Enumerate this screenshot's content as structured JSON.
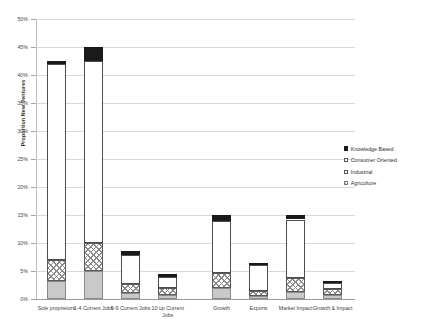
{
  "chart_data": {
    "type": "bar",
    "title": "",
    "subtitle": "",
    "xlabel": "",
    "ylabel": "Proportion New Ventures",
    "ylim": [
      0,
      50
    ],
    "ytick_labels": [
      "0%",
      "5%",
      "10%",
      "15%",
      "20%",
      "25%",
      "30%",
      "35%",
      "40%",
      "45%",
      "50%"
    ],
    "ytick_values": [
      0,
      5,
      10,
      15,
      20,
      25,
      30,
      35,
      40,
      45,
      50
    ],
    "grid": true,
    "stacked": true,
    "legend_position": "middle-right",
    "categories": [
      "Sole proprietors",
      "1-4 Current Jobs",
      "5-9 Current Jobs",
      "10 up Current Jobs",
      "Growth",
      "Exports",
      "Market Impact",
      "Growth & Impact"
    ],
    "series": [
      {
        "name": "Agriculture",
        "values": [
          3.3,
          5.0,
          1.0,
          0.7,
          2.0,
          0.6,
          1.2,
          0.8
        ]
      },
      {
        "name": "Industrial",
        "values": [
          3.6,
          5.0,
          1.6,
          1.3,
          2.7,
          0.9,
          2.6,
          1.0
        ]
      },
      {
        "name": "Consumer Oriented",
        "values": [
          35.1,
          32.5,
          5.3,
          2.0,
          9.3,
          4.6,
          10.4,
          1.0
        ]
      },
      {
        "name": "Knowledge Based",
        "values": [
          0.5,
          2.5,
          0.6,
          0.5,
          1.0,
          0.3,
          0.8,
          0.2
        ]
      }
    ],
    "totals": [
      42.5,
      45.0,
      8.5,
      4.5,
      15.0,
      6.4,
      15.0,
      3.0
    ]
  },
  "legend": {
    "items": [
      {
        "label": "Knowledge Based",
        "swatch": "knowledge",
        "color": "#1a1a1a"
      },
      {
        "label": "Consumer Oriented",
        "swatch": "consumer",
        "color": "#ffffff"
      },
      {
        "label": "Industrial",
        "swatch": "industrial",
        "color": "#ffffff"
      },
      {
        "label": "Agriculture",
        "swatch": "agriculture",
        "color": "#c9c9c9"
      }
    ]
  }
}
